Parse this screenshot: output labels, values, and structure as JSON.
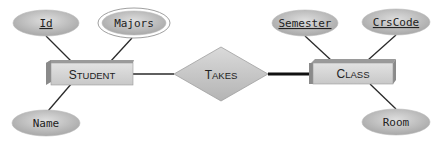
{
  "diagram": {
    "type": "entity-relationship",
    "entities": [
      {
        "id": "student",
        "label_first": "S",
        "label_rest": "TUDENT"
      },
      {
        "id": "class",
        "label_first": "C",
        "label_rest": "LASS"
      }
    ],
    "relationships": [
      {
        "id": "takes",
        "label_first": "T",
        "label_rest": "AKES",
        "connects": [
          "student",
          "class"
        ],
        "thick_side": "class"
      }
    ],
    "attributes": [
      {
        "id": "id",
        "label": "Id",
        "entity": "student",
        "key": true,
        "multivalued": false
      },
      {
        "id": "majors",
        "label": "Majors",
        "entity": "student",
        "key": false,
        "multivalued": true
      },
      {
        "id": "name",
        "label": "Name",
        "entity": "student",
        "key": false,
        "multivalued": false
      },
      {
        "id": "semester",
        "label": "Semester",
        "entity": "class",
        "key": true,
        "multivalued": false
      },
      {
        "id": "crscode",
        "label": "CrsCode",
        "entity": "class",
        "key": true,
        "multivalued": false
      },
      {
        "id": "room",
        "label": "Room",
        "entity": "class",
        "key": false,
        "multivalued": false
      }
    ],
    "colors": {
      "ellipse_fill": "#c4c4c4",
      "entity_front": "#d6d6d6",
      "entity_side": "#8c8c8c",
      "diamond_fill": "#cfcfcf",
      "line": "#2a2a2a"
    }
  }
}
